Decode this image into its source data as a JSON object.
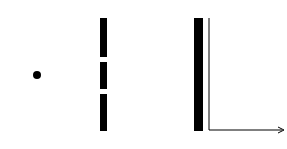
{
  "diagram": {
    "source": {
      "cx": 37,
      "cy": 75,
      "dot_r": 4
    },
    "barrier": {
      "x": 100,
      "w": 7,
      "top": 18,
      "bottom": 131,
      "slits": [
        {
          "y1": 57,
          "y2": 62
        },
        {
          "y1": 89,
          "y2": 94
        }
      ]
    },
    "screen": {
      "x": 194,
      "w": 9,
      "top": 18,
      "bottom": 131
    },
    "graph": {
      "axis_x": 209,
      "axis_bottom": 130,
      "arrow_end": 284,
      "x_label": "세기"
    },
    "colors": {
      "ink": "#000000",
      "bg": "#ffffff"
    }
  }
}
